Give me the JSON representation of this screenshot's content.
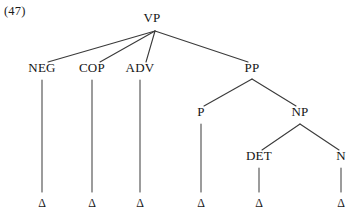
{
  "figure": {
    "example_number": "(47)",
    "width": 355,
    "height": 217,
    "background_color": "#ffffff",
    "line_color": "#3a3a3a",
    "text_color": "#141414"
  },
  "tree": {
    "type": "phrase-structure-tree",
    "root": "VP",
    "nodes": [
      {
        "id": "VP",
        "label": "VP",
        "x": 152,
        "y": 22,
        "level": 0
      },
      {
        "id": "NEG",
        "label": "NEG",
        "x": 42,
        "y": 72,
        "level": 1
      },
      {
        "id": "COP",
        "label": "COP",
        "x": 92,
        "y": 72,
        "level": 1
      },
      {
        "id": "ADV",
        "label": "ADV",
        "x": 140,
        "y": 72,
        "level": 1
      },
      {
        "id": "PP",
        "label": "PP",
        "x": 252,
        "y": 72,
        "level": 1
      },
      {
        "id": "P",
        "label": "P",
        "x": 201,
        "y": 116,
        "level": 2
      },
      {
        "id": "NP",
        "label": "NP",
        "x": 300,
        "y": 116,
        "level": 2
      },
      {
        "id": "DET",
        "label": "DET",
        "x": 259,
        "y": 160,
        "level": 3
      },
      {
        "id": "N",
        "label": "N",
        "x": 341,
        "y": 160,
        "level": 3
      }
    ],
    "terminals": [
      {
        "id": "t-neg",
        "label": "Δ",
        "x": 42,
        "y": 207,
        "parent": "NEG"
      },
      {
        "id": "t-cop",
        "label": "Δ",
        "x": 92,
        "y": 207,
        "parent": "COP"
      },
      {
        "id": "t-adv",
        "label": "Δ",
        "x": 140,
        "y": 207,
        "parent": "ADV"
      },
      {
        "id": "t-p",
        "label": "Δ",
        "x": 201,
        "y": 207,
        "parent": "P"
      },
      {
        "id": "t-det",
        "label": "Δ",
        "x": 259,
        "y": 207,
        "parent": "DET"
      },
      {
        "id": "t-n",
        "label": "Δ",
        "x": 341,
        "y": 207,
        "parent": "N"
      }
    ],
    "edges": [
      {
        "from": "VP",
        "to": "NEG",
        "x1": 155,
        "y1": 31,
        "x2": 48,
        "y2": 62,
        "style": "diagonal"
      },
      {
        "from": "VP",
        "to": "COP",
        "x1": 155,
        "y1": 31,
        "x2": 100,
        "y2": 62,
        "style": "diagonal"
      },
      {
        "from": "VP",
        "to": "ADV",
        "x1": 155,
        "y1": 31,
        "x2": 146,
        "y2": 62,
        "style": "diagonal"
      },
      {
        "from": "VP",
        "to": "PP",
        "x1": 155,
        "y1": 31,
        "x2": 248,
        "y2": 62,
        "style": "diagonal"
      },
      {
        "from": "PP",
        "to": "P",
        "x1": 252,
        "y1": 79,
        "x2": 204,
        "y2": 106,
        "style": "diagonal"
      },
      {
        "from": "PP",
        "to": "NP",
        "x1": 252,
        "y1": 79,
        "x2": 296,
        "y2": 106,
        "style": "diagonal"
      },
      {
        "from": "NP",
        "to": "DET",
        "x1": 300,
        "y1": 124,
        "x2": 262,
        "y2": 150,
        "style": "diagonal"
      },
      {
        "from": "NP",
        "to": "N",
        "x1": 300,
        "y1": 124,
        "x2": 339,
        "y2": 150,
        "style": "diagonal"
      },
      {
        "from": "NEG",
        "to": "t-neg",
        "x1": 42,
        "y1": 80,
        "x2": 42,
        "y2": 192,
        "style": "vertical"
      },
      {
        "from": "COP",
        "to": "t-cop",
        "x1": 92,
        "y1": 80,
        "x2": 92,
        "y2": 192,
        "style": "vertical"
      },
      {
        "from": "ADV",
        "to": "t-adv",
        "x1": 140,
        "y1": 80,
        "x2": 140,
        "y2": 192,
        "style": "vertical"
      },
      {
        "from": "P",
        "to": "t-p",
        "x1": 201,
        "y1": 124,
        "x2": 201,
        "y2": 192,
        "style": "vertical"
      },
      {
        "from": "DET",
        "to": "t-det",
        "x1": 259,
        "y1": 168,
        "x2": 259,
        "y2": 192,
        "style": "vertical"
      },
      {
        "from": "N",
        "to": "t-n",
        "x1": 341,
        "y1": 168,
        "x2": 341,
        "y2": 192,
        "style": "vertical"
      }
    ]
  }
}
